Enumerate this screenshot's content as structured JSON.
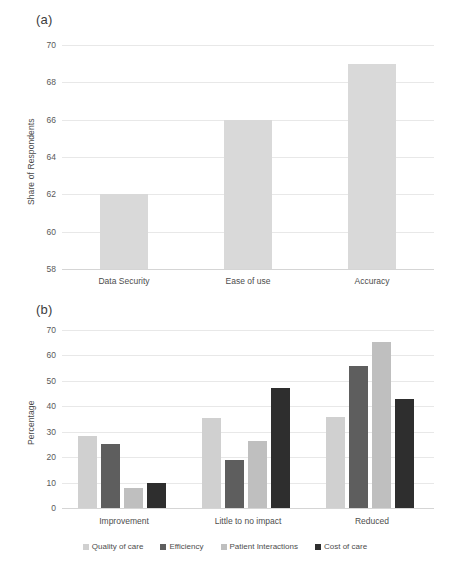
{
  "figure": {
    "panel_a_label": "(a)",
    "panel_b_label": "(b)"
  },
  "chart_data": [
    {
      "type": "bar",
      "panel": "(a)",
      "title": "",
      "xlabel": "",
      "ylabel": "Share of Respondents",
      "categories": [
        "Data Security",
        "Ease of use",
        "Accuracy"
      ],
      "values": [
        62,
        66,
        69
      ],
      "yticks": [
        58,
        60,
        62,
        64,
        66,
        68,
        70
      ],
      "ylim": [
        58,
        70
      ],
      "grid": true,
      "legend": "none",
      "bar_color": "#D9D9D9"
    },
    {
      "type": "bar",
      "panel": "(b)",
      "title": "",
      "xlabel": "",
      "ylabel": "Percentage",
      "categories": [
        "Improvement",
        "Little to no impact",
        "Reduced"
      ],
      "series": [
        {
          "name": "Quality of care",
          "color": "#D0D0D0",
          "values": [
            28.5,
            35.5,
            35.6
          ]
        },
        {
          "name": "Efficiency",
          "color": "#5E5E5E",
          "values": [
            25.0,
            18.7,
            56.0
          ]
        },
        {
          "name": "Patient Interactions",
          "color": "#BFBFBF",
          "values": [
            8.0,
            26.3,
            65.3
          ]
        },
        {
          "name": "Cost of care",
          "color": "#2E2E2E",
          "values": [
            9.7,
            47.3,
            42.8
          ]
        }
      ],
      "yticks": [
        0,
        10,
        20,
        30,
        40,
        50,
        60,
        70
      ],
      "ylim": [
        0,
        70
      ],
      "grid": true,
      "legend": "bottom"
    }
  ]
}
